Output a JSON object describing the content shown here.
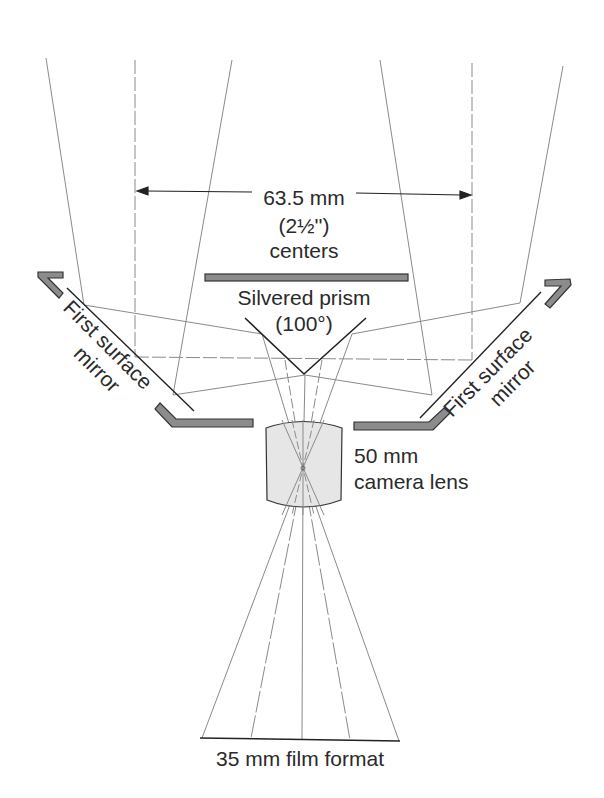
{
  "diagram": {
    "labels": {
      "spacing_value": "63.5 mm",
      "spacing_inches": "(2½'')",
      "spacing_note": "centers",
      "prism_name": "Silvered prism",
      "prism_angle": "(100°)",
      "left_mirror_line1": "First surface",
      "left_mirror_line2": "mirror",
      "right_mirror_line1": "First surface",
      "right_mirror_line2": "mirror",
      "lens_line1": "50 mm",
      "lens_line2": "camera lens",
      "film": "35 mm film format"
    },
    "colors": {
      "line": "#555555",
      "ray": "#8a8a8a",
      "plate_fill": "#8c8c8c",
      "plate_stroke": "#333333",
      "lens_fill": "#e6e6e6",
      "text": "#2a2a2a"
    }
  }
}
